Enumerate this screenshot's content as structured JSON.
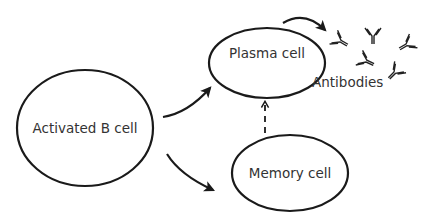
{
  "diagram": {
    "nodes": [
      {
        "id": "activated_b_cell",
        "label": "Activated B cell"
      },
      {
        "id": "plasma_cell",
        "label": "Plasma cell"
      },
      {
        "id": "memory_cell",
        "label": "Memory cell"
      },
      {
        "id": "antibodies",
        "label": "Antibodies"
      }
    ],
    "edges": [
      {
        "from": "activated_b_cell",
        "to": "plasma_cell",
        "style": "solid"
      },
      {
        "from": "activated_b_cell",
        "to": "memory_cell",
        "style": "solid"
      },
      {
        "from": "memory_cell",
        "to": "plasma_cell",
        "style": "dashed"
      },
      {
        "from": "plasma_cell",
        "to": "antibodies",
        "style": "solid"
      }
    ],
    "antibody_icon_count": 5,
    "colors": {
      "stroke": "#1a1a1a",
      "text": "#333333",
      "background": "#ffffff"
    }
  }
}
